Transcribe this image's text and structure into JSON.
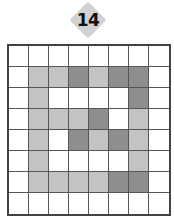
{
  "puzzle": {
    "number": "14",
    "badge_color": "#d2d2d2",
    "palette": {
      "W": "#ffffff",
      "L": "#c3c3c3",
      "D": "#8e8e8e"
    },
    "grid": [
      [
        "W",
        "W",
        "W",
        "W",
        "W",
        "W",
        "W",
        "W"
      ],
      [
        "W",
        "L",
        "L",
        "D",
        "L",
        "D",
        "D",
        "W"
      ],
      [
        "W",
        "L",
        "W",
        "W",
        "W",
        "W",
        "D",
        "W"
      ],
      [
        "W",
        "L",
        "L",
        "L",
        "D",
        "W",
        "L",
        "W"
      ],
      [
        "W",
        "L",
        "W",
        "D",
        "L",
        "D",
        "L",
        "W"
      ],
      [
        "W",
        "L",
        "W",
        "W",
        "W",
        "W",
        "L",
        "W"
      ],
      [
        "W",
        "L",
        "L",
        "L",
        "L",
        "D",
        "D",
        "W"
      ],
      [
        "W",
        "W",
        "W",
        "W",
        "W",
        "W",
        "W",
        "W"
      ]
    ]
  }
}
